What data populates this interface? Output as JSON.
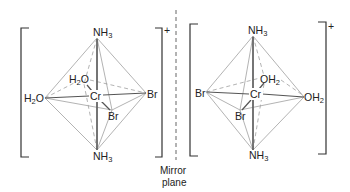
{
  "figure": {
    "type": "stereochemistry-enantiomers",
    "mirror_label": [
      "Mirror",
      "plane"
    ],
    "left_complex": {
      "charge": "+",
      "metal": "Cr",
      "ligands": {
        "top": {
          "main": "NH",
          "sub": "3"
        },
        "bottom": {
          "main": "NH",
          "sub": "3"
        },
        "left": {
          "pre": "H",
          "sub": "2",
          "post": "O"
        },
        "back": {
          "pre": "H",
          "sub": "2",
          "post": "O"
        },
        "right": {
          "main": "Br"
        },
        "front": {
          "main": "Br"
        }
      }
    },
    "right_complex": {
      "charge": "+",
      "metal": "Cr",
      "ligands": {
        "top": {
          "main": "NH",
          "sub": "3"
        },
        "bottom": {
          "main": "NH",
          "sub": "3"
        },
        "left": {
          "main": "Br"
        },
        "front": {
          "main": "Br"
        },
        "back": {
          "main": "OH",
          "sub": "2"
        },
        "right": {
          "main": "OH",
          "sub": "2"
        }
      }
    },
    "colors": {
      "edge": "#a0a0a0",
      "bond": "#555555",
      "text": "#222222"
    }
  }
}
